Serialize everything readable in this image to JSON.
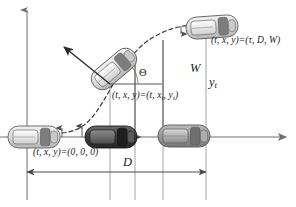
{
  "figure": {
    "labels": {
      "origin_coord": "(t, x, y)=(0, 0, 0)",
      "mid_coord_prefix": "(t, x, y)=(t, x",
      "mid_coord_sub1": "t",
      "mid_coord_mid": ", y",
      "mid_coord_sub2": "t",
      "mid_coord_suffix": ")",
      "end_coord": "(t, x, y)=(τ, D, W)",
      "heading_angle": "Θ",
      "lateral_offset_total": "W",
      "lateral_offset_t_base": "y",
      "lateral_offset_t_sub": "t",
      "longitudinal_distance": "D"
    },
    "colors": {
      "axis": "#6e6e6e",
      "trajectory": "#3a3a3a",
      "car_light": "#d9d9d9",
      "car_dark": "#4a4a4a",
      "car_mid": "#9a9a9a",
      "text": "#1a1a1a"
    },
    "cars": [
      {
        "name": "car-start-left",
        "x": 10,
        "y": 126,
        "w": 52,
        "h": 22,
        "rotation": 0,
        "shade": "light"
      },
      {
        "name": "car-lane-origin",
        "x": 87,
        "y": 126,
        "w": 52,
        "h": 22,
        "rotation": 0,
        "shade": "dark"
      },
      {
        "name": "car-transition",
        "x": 89,
        "y": 60,
        "w": 52,
        "h": 22,
        "rotation": -38,
        "shade": "light"
      },
      {
        "name": "car-target-top",
        "x": 188,
        "y": 14,
        "w": 52,
        "h": 22,
        "rotation": -4,
        "shade": "light"
      },
      {
        "name": "car-lane-end",
        "x": 160,
        "y": 126,
        "w": 52,
        "h": 22,
        "rotation": 0,
        "shade": "mid"
      }
    ],
    "axes": {
      "y_axis_x": 27,
      "x_axis_y": 137,
      "x_axis_end": 288,
      "y_axis_top": 8
    },
    "guides": {
      "vertical_lines_x": [
        27,
        110,
        135,
        163,
        206
      ],
      "dimension_D": {
        "from_x": 27,
        "to_x": 206,
        "y": 172
      }
    },
    "trajectory": {
      "type": "dashed-s-curve",
      "start": [
        62,
        133
      ],
      "end": [
        196,
        26
      ]
    }
  }
}
